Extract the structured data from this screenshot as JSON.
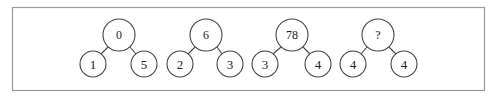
{
  "diagram": {
    "trees": [
      {
        "top": "0",
        "left": "1",
        "right": "5",
        "cx": 119,
        "lx": 93,
        "rx": 144
      },
      {
        "top": "6",
        "left": "2",
        "right": "3",
        "cx": 206,
        "lx": 180,
        "rx": 230
      },
      {
        "top": "78",
        "left": "3",
        "right": "4",
        "cx": 292,
        "lx": 265,
        "rx": 318
      },
      {
        "top": "?",
        "left": "4",
        "right": "4",
        "cx": 378,
        "lx": 353,
        "rx": 404
      }
    ],
    "colors": {
      "stroke": "#444444",
      "frame": "#9a9a9a",
      "background": "#ffffff"
    }
  }
}
